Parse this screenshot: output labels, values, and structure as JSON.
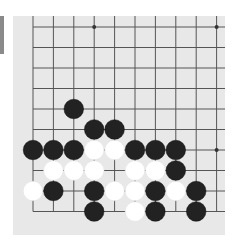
{
  "board": {
    "background": "#e8e8e8",
    "line_color": "#555555",
    "columns_visible": 10,
    "rows_visible": 10,
    "edges": [
      "left",
      "bottom"
    ],
    "origin_px": [
      20,
      11
    ],
    "spacing_px": [
      20.4,
      20.5
    ],
    "star_points": [
      [
        3,
        0
      ],
      [
        9,
        0
      ],
      [
        9,
        6
      ]
    ],
    "stones": [
      {
        "color": "black",
        "col": 2,
        "row": 4
      },
      {
        "color": "black",
        "col": 3,
        "row": 5
      },
      {
        "color": "black",
        "col": 4,
        "row": 5
      },
      {
        "color": "black",
        "col": 0,
        "row": 6
      },
      {
        "color": "black",
        "col": 1,
        "row": 6
      },
      {
        "color": "black",
        "col": 2,
        "row": 6
      },
      {
        "color": "white",
        "col": 3,
        "row": 6
      },
      {
        "color": "white",
        "col": 4,
        "row": 6
      },
      {
        "color": "black",
        "col": 5,
        "row": 6
      },
      {
        "color": "black",
        "col": 6,
        "row": 6
      },
      {
        "color": "black",
        "col": 7,
        "row": 6
      },
      {
        "color": "white",
        "col": 1,
        "row": 7
      },
      {
        "color": "white",
        "col": 2,
        "row": 7
      },
      {
        "color": "white",
        "col": 3,
        "row": 7
      },
      {
        "color": "white",
        "col": 5,
        "row": 7
      },
      {
        "color": "white",
        "col": 6,
        "row": 7
      },
      {
        "color": "black",
        "col": 7,
        "row": 7
      },
      {
        "color": "white",
        "col": 0,
        "row": 8
      },
      {
        "color": "black",
        "col": 1,
        "row": 8
      },
      {
        "color": "black",
        "col": 3,
        "row": 8
      },
      {
        "color": "white",
        "col": 4,
        "row": 8
      },
      {
        "color": "white",
        "col": 5,
        "row": 8
      },
      {
        "color": "black",
        "col": 6,
        "row": 8
      },
      {
        "color": "white",
        "col": 7,
        "row": 8
      },
      {
        "color": "black",
        "col": 8,
        "row": 8
      },
      {
        "color": "black",
        "col": 3,
        "row": 9
      },
      {
        "color": "white",
        "col": 5,
        "row": 9
      },
      {
        "color": "black",
        "col": 6,
        "row": 9
      },
      {
        "color": "black",
        "col": 8,
        "row": 9
      }
    ],
    "colors": {
      "black": "#222222",
      "white": "#ffffff"
    }
  },
  "side_bar": {
    "color": "#8a8a8a"
  }
}
